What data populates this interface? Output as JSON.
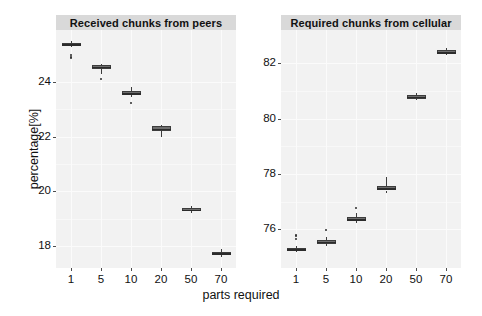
{
  "chart_data": {
    "type": "box",
    "title": "",
    "xlabel": "parts required",
    "ylabel": "percentage[%]",
    "categories": [
      "1",
      "5",
      "10",
      "20",
      "50",
      "70"
    ],
    "panels": [
      {
        "label": "Received chunks from peers",
        "ylim": [
          17.2,
          25.9
        ],
        "yticks": [
          18,
          20,
          22,
          24
        ],
        "ytick_labels": [
          "18",
          "20",
          "22",
          "24"
        ],
        "boxes": [
          {
            "category": "1",
            "q1": 25.32,
            "median": 25.38,
            "q3": 25.44,
            "lower_whisker": 25.28,
            "upper_whisker": 25.5,
            "outliers": [
              25.0,
              24.92,
              24.86
            ]
          },
          {
            "category": "5",
            "q1": 24.46,
            "median": 24.55,
            "q3": 24.62,
            "lower_whisker": 24.3,
            "upper_whisker": 24.66,
            "outliers": [
              24.12
            ]
          },
          {
            "category": "10",
            "q1": 23.52,
            "median": 23.58,
            "q3": 23.66,
            "lower_whisker": 23.44,
            "upper_whisker": 23.8,
            "outliers": [
              23.22
            ]
          },
          {
            "category": "20",
            "q1": 22.22,
            "median": 22.28,
            "q3": 22.38,
            "lower_whisker": 22.0,
            "upper_whisker": 22.44,
            "outliers": []
          },
          {
            "category": "50",
            "q1": 19.28,
            "median": 19.33,
            "q3": 19.4,
            "lower_whisker": 19.22,
            "upper_whisker": 19.46,
            "outliers": []
          },
          {
            "category": "70",
            "q1": 17.7,
            "median": 17.74,
            "q3": 17.8,
            "lower_whisker": 17.62,
            "upper_whisker": 17.9,
            "outliers": []
          }
        ]
      },
      {
        "label": "Required chunks from cellular",
        "ylim": [
          74.6,
          83.2
        ],
        "yticks": [
          76,
          78,
          80,
          82
        ],
        "ytick_labels": [
          "76",
          "78",
          "80",
          "82"
        ],
        "boxes": [
          {
            "category": "1",
            "q1": 75.22,
            "median": 75.28,
            "q3": 75.34,
            "lower_whisker": 75.16,
            "upper_whisker": 75.4,
            "outliers": [
              75.66,
              75.74,
              75.8
            ]
          },
          {
            "category": "5",
            "q1": 75.48,
            "median": 75.54,
            "q3": 75.62,
            "lower_whisker": 75.4,
            "upper_whisker": 75.72,
            "outliers": [
              75.96
            ]
          },
          {
            "category": "10",
            "q1": 76.3,
            "median": 76.36,
            "q3": 76.44,
            "lower_whisker": 76.22,
            "upper_whisker": 76.58,
            "outliers": [
              76.78
            ]
          },
          {
            "category": "20",
            "q1": 77.4,
            "median": 77.48,
            "q3": 77.58,
            "lower_whisker": 77.32,
            "upper_whisker": 77.88,
            "outliers": []
          },
          {
            "category": "50",
            "q1": 80.72,
            "median": 80.78,
            "q3": 80.86,
            "lower_whisker": 80.66,
            "upper_whisker": 80.92,
            "outliers": []
          },
          {
            "category": "70",
            "q1": 82.34,
            "median": 82.4,
            "q3": 82.48,
            "lower_whisker": 82.28,
            "upper_whisker": 82.54,
            "outliers": []
          }
        ]
      }
    ],
    "grid": true,
    "legend": "none",
    "panel_background": "#f2f2f2",
    "strip_background": "#d9d9d9",
    "box_fill": "#6e6e6e",
    "box_stroke": "#3d3d3d"
  }
}
